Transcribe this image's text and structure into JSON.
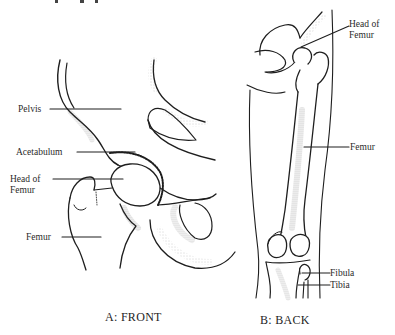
{
  "figure": {
    "panels": [
      {
        "id": "A",
        "caption": "A: FRONT",
        "labels": [
          {
            "text": "Pelvis"
          },
          {
            "text": "Acetabulum"
          },
          {
            "text": "Head of Femur"
          },
          {
            "text": "Femur"
          }
        ]
      },
      {
        "id": "B",
        "caption": "B: BACK",
        "labels": [
          {
            "text": "Head of Femur"
          },
          {
            "text": "Femur"
          },
          {
            "text": "Fibula"
          },
          {
            "text": "Tibia"
          }
        ]
      }
    ]
  },
  "colors": {
    "ink": "#1e1e1e",
    "background": "#ffffff"
  }
}
